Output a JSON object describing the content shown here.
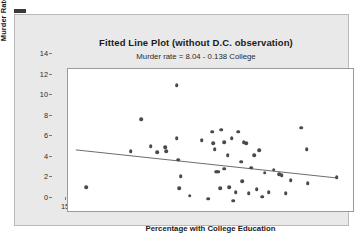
{
  "chart_data": {
    "type": "scatter",
    "title": "Fitted Line Plot (without D.C. observation)",
    "subtitle": "Murder rate =  8.04 - 0.138 College",
    "xlabel": "Percentage with College Education",
    "ylabel": "Murder Rate",
    "xlim": [
      14.0,
      35.9
    ],
    "ylim": [
      0,
      14
    ],
    "xticks": [
      15,
      20,
      25,
      30,
      35
    ],
    "yticks": [
      0,
      2,
      4,
      6,
      8,
      10,
      12,
      14
    ],
    "grid": false,
    "legend": false,
    "point_color": "#4a4a4a",
    "line_color": "#6a6a6a",
    "fit": {
      "intercept": 8.04,
      "slope": -0.138,
      "x_start": 14.6,
      "x_end": 34.6,
      "equation": "Murder rate =  8.04 - 0.138 College"
    },
    "points": [
      [
        15.4,
        2.5
      ],
      [
        18.8,
        6.0
      ],
      [
        19.6,
        9.1
      ],
      [
        20.3,
        6.5
      ],
      [
        20.8,
        5.9
      ],
      [
        21.4,
        6.4
      ],
      [
        21.5,
        6.0
      ],
      [
        22.3,
        12.4
      ],
      [
        22.3,
        7.3
      ],
      [
        22.4,
        5.2
      ],
      [
        22.5,
        2.4
      ],
      [
        22.6,
        3.6
      ],
      [
        23.3,
        1.7
      ],
      [
        24.2,
        7.1
      ],
      [
        24.7,
        1.4
      ],
      [
        25.0,
        7.9
      ],
      [
        25.1,
        6.8
      ],
      [
        25.2,
        6.2
      ],
      [
        25.3,
        4.0
      ],
      [
        25.4,
        4.0
      ],
      [
        25.5,
        4.0
      ],
      [
        25.6,
        2.4
      ],
      [
        25.7,
        8.1
      ],
      [
        25.9,
        4.3
      ],
      [
        25.9,
        6.9
      ],
      [
        26.2,
        5.6
      ],
      [
        26.3,
        2.5
      ],
      [
        26.5,
        7.3
      ],
      [
        26.6,
        1.2
      ],
      [
        26.8,
        2.0
      ],
      [
        27.0,
        7.9
      ],
      [
        27.2,
        5.0
      ],
      [
        27.3,
        3.1
      ],
      [
        27.4,
        6.9
      ],
      [
        27.6,
        6.8
      ],
      [
        27.8,
        1.9
      ],
      [
        28.0,
        4.4
      ],
      [
        28.2,
        5.6
      ],
      [
        28.4,
        2.3
      ],
      [
        28.6,
        6.1
      ],
      [
        28.8,
        1.6
      ],
      [
        29.0,
        3.9
      ],
      [
        29.3,
        2.0
      ],
      [
        29.7,
        4.2
      ],
      [
        30.1,
        3.8
      ],
      [
        30.3,
        3.7
      ],
      [
        30.6,
        1.9
      ],
      [
        31.0,
        3.2
      ],
      [
        31.8,
        8.3
      ],
      [
        32.2,
        6.2
      ],
      [
        32.3,
        2.9
      ],
      [
        34.5,
        3.5
      ]
    ]
  }
}
